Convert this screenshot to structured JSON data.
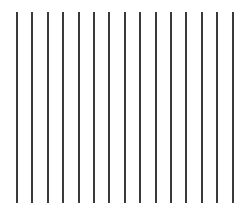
{
  "figure": {
    "line_count": 15,
    "line_color": "#3a3a3a",
    "background": "#ffffff",
    "first_x": 16,
    "spacing": 15.4,
    "top_y": 12,
    "bottom_y": 203,
    "line_width": 2
  }
}
